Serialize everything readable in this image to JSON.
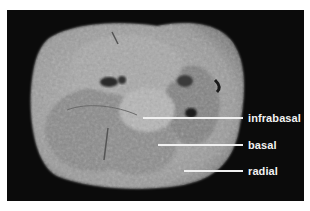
{
  "figure": {
    "background_color": "#0b0b0b",
    "label_color": "#f2f2f2",
    "labels": [
      {
        "text": "infrabasal"
      },
      {
        "text": "basal"
      },
      {
        "text": "radial"
      }
    ]
  }
}
